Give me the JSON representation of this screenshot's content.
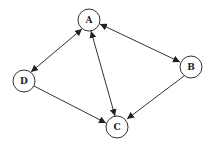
{
  "diagram": {
    "type": "directed-graph",
    "nodes": [
      {
        "id": "A",
        "label": "A",
        "x": 89,
        "y": 20
      },
      {
        "id": "B",
        "label": "B",
        "x": 191,
        "y": 67
      },
      {
        "id": "C",
        "label": "C",
        "x": 117,
        "y": 127
      },
      {
        "id": "D",
        "label": "D",
        "x": 24,
        "y": 81
      }
    ],
    "edges": [
      {
        "from": "A",
        "to": "D",
        "bidirectional": true
      },
      {
        "from": "A",
        "to": "C",
        "bidirectional": true
      },
      {
        "from": "A",
        "to": "B",
        "bidirectional": true
      },
      {
        "from": "D",
        "to": "C",
        "bidirectional": false
      },
      {
        "from": "B",
        "to": "C",
        "bidirectional": false
      }
    ],
    "colors": {
      "stroke": "#333333",
      "fill": "#ffffff",
      "text": "#222222"
    }
  }
}
